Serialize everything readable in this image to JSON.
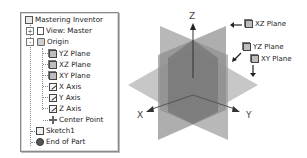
{
  "browser_tree": {
    "root": {
      "label": "Mastering Inventor",
      "icon": "part-icon"
    },
    "items": [
      {
        "label": "View: Master",
        "icon": "view-icon",
        "expander": "+"
      },
      {
        "label": "Origin",
        "icon": "folder-icon",
        "expander": "-"
      },
      {
        "label": "YZ Plane",
        "icon": "plane-icon"
      },
      {
        "label": "XZ Plane",
        "icon": "plane-icon"
      },
      {
        "label": "XY Plane",
        "icon": "plane-icon"
      },
      {
        "label": "X Axis",
        "icon": "axis-icon"
      },
      {
        "label": "Y Axis",
        "icon": "axis-icon"
      },
      {
        "label": "Z Axis",
        "icon": "axis-icon"
      },
      {
        "label": "Center Point",
        "icon": "center-point-icon"
      },
      {
        "label": "Sketch1",
        "icon": "sketch-icon"
      },
      {
        "label": "End of Part",
        "icon": "end-of-part-icon"
      }
    ]
  },
  "viewport": {
    "axes": {
      "x": "X",
      "y": "Y",
      "z": "Z"
    },
    "callouts": [
      {
        "label": "XZ Plane",
        "arrow": "left"
      },
      {
        "label": "YZ Plane",
        "arrow": "down-left"
      },
      {
        "label": "XY Plane",
        "arrow": "down"
      }
    ],
    "colors": {
      "plane_light": "#b9b9b9",
      "plane_mid": "#8f8f8f",
      "plane_dark": "#6e6e6e",
      "axis": "#333333"
    }
  }
}
